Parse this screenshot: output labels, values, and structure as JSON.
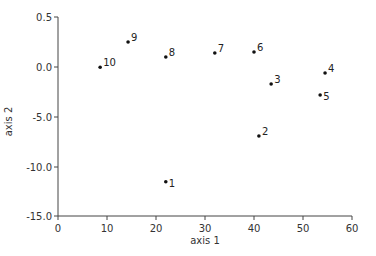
{
  "chart_data": {
    "type": "scatter",
    "title": "",
    "xlabel": "axis 1",
    "ylabel": "axis 2",
    "xlim": [
      0,
      60
    ],
    "x_ticks": [
      0,
      10,
      20,
      30,
      40,
      50,
      60
    ],
    "x_tick_labels": [
      "0",
      "10",
      "20",
      "30",
      "40",
      "50",
      "60"
    ],
    "y_tick_labels": [
      "0.5",
      "0.0",
      "-5.0",
      "-10.0",
      "-15.0"
    ],
    "y_tick_values": [
      0.5,
      0.0,
      -5.0,
      -10.0,
      -15.0
    ],
    "grid": false,
    "legend": null,
    "points": [
      {
        "label": "1",
        "x": 22.0,
        "y": -11.5
      },
      {
        "label": "2",
        "x": 41.0,
        "y": -6.9
      },
      {
        "label": "3",
        "x": 43.5,
        "y": -1.7
      },
      {
        "label": "4",
        "x": 54.5,
        "y": -0.6
      },
      {
        "label": "5",
        "x": 53.5,
        "y": -2.8
      },
      {
        "label": "6",
        "x": 40.0,
        "y": 0.15
      },
      {
        "label": "7",
        "x": 32.0,
        "y": 0.14
      },
      {
        "label": "8",
        "x": 22.0,
        "y": 0.1
      },
      {
        "label": "9",
        "x": 14.3,
        "y": 0.25
      },
      {
        "label": "10",
        "x": 8.6,
        "y": -0.02
      }
    ]
  }
}
